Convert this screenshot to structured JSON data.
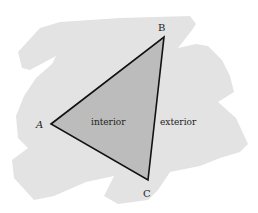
{
  "figure": {
    "type": "triangle-interior-exterior",
    "colors": {
      "background": "#ffffff",
      "exterior_blob": "#e3e3e3",
      "interior_fill": "#bcbcbc",
      "edge": "#111111",
      "text": "#222222"
    },
    "vertices": {
      "A": {
        "label": "A",
        "x": 51,
        "y": 124
      },
      "B": {
        "label": "B",
        "x": 164,
        "y": 37
      },
      "C": {
        "label": "C",
        "x": 148,
        "y": 180
      }
    },
    "regions": {
      "interior": {
        "label": "interior"
      },
      "exterior": {
        "label": "exterior"
      }
    }
  }
}
